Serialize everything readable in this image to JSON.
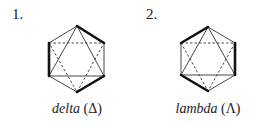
{
  "figures": [
    {
      "number": "1.",
      "name": "delta",
      "symbol": "(Δ)",
      "thick_edges": [
        "top-upperright",
        "upperleft-lowerleft",
        "bottom-lowerright"
      ]
    },
    {
      "number": "2.",
      "name": "lambda",
      "symbol": "(Λ)",
      "thick_edges": [
        "upperleft-top",
        "upperright-lowerright",
        "lowerleft-bottom"
      ]
    }
  ],
  "colors": {
    "line": "#333333",
    "thick": "#111111"
  }
}
